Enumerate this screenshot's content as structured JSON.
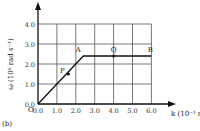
{
  "chart_data": {
    "type": "line",
    "title": "",
    "panel_label": "(b)",
    "xlabel": "k (10⁻³ m⁻¹)",
    "ylabel": "ω (10⁶ rad s⁻¹)",
    "origin_label": "O",
    "xlim": [
      0,
      6.0
    ],
    "ylim": [
      0,
      4.0
    ],
    "x_ticks": [
      "0.0",
      "1.0",
      "2.0",
      "3.0",
      "4.0",
      "5.0",
      "6.0"
    ],
    "y_ticks": [
      "0.0",
      "1.0",
      "2.0",
      "3.0",
      "4.0"
    ],
    "grid": true,
    "series": [
      {
        "name": "dispersion",
        "x": [
          0.0,
          2.4,
          6.0
        ],
        "y": [
          0.0,
          2.4,
          2.4
        ]
      }
    ],
    "points": [
      {
        "label": "P",
        "x": 1.5,
        "y": 1.5
      },
      {
        "label": "A",
        "x": 2.4,
        "y": 2.4
      },
      {
        "label": "Q",
        "x": 4.0,
        "y": 2.4
      },
      {
        "label": "B",
        "x": 6.0,
        "y": 2.4
      }
    ]
  }
}
